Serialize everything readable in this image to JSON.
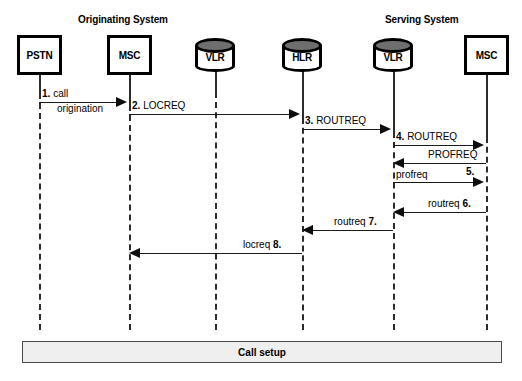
{
  "diagram": {
    "type": "sequence",
    "group_labels": [
      {
        "text": "Originating System",
        "x": 78,
        "y": 14
      },
      {
        "text": "Serving System",
        "x": 385,
        "y": 14
      }
    ],
    "actors": [
      {
        "id": "pstn",
        "label": "PSTN",
        "shape": "box",
        "x": 39,
        "box_left": 17,
        "box_top": 35,
        "box_w": 45,
        "box_h": 40
      },
      {
        "id": "msc_o",
        "label": "MSC",
        "shape": "box",
        "x": 129,
        "box_left": 107,
        "box_top": 35,
        "box_w": 45,
        "box_h": 40
      },
      {
        "id": "vlr_o",
        "label": "VLR",
        "shape": "cylinder",
        "x": 215,
        "box_left": 195,
        "box_top": 38,
        "box_w": 40,
        "box_h": 36
      },
      {
        "id": "hlr",
        "label": "HLR",
        "shape": "cylinder",
        "x": 302,
        "box_left": 282,
        "box_top": 38,
        "box_w": 40,
        "box_h": 36
      },
      {
        "id": "vlr_s",
        "label": "VLR",
        "shape": "cylinder",
        "x": 393,
        "box_left": 373,
        "box_top": 38,
        "box_w": 40,
        "box_h": 36
      },
      {
        "id": "msc_s",
        "label": "MSC",
        "shape": "box",
        "x": 486,
        "box_left": 464,
        "box_top": 35,
        "box_w": 45,
        "box_h": 40
      }
    ],
    "messages": [
      {
        "num": "1.",
        "label": "call",
        "label2": "origination",
        "from": "pstn",
        "to": "msc_o",
        "from_x": 39,
        "to_x": 129,
        "y": 102,
        "dir": "right"
      },
      {
        "num": "2.",
        "label": "LOCREQ",
        "from": "msc_o",
        "to": "hlr",
        "from_x": 129,
        "to_x": 302,
        "y": 114,
        "dir": "right"
      },
      {
        "num": "3.",
        "label": "ROUTREQ",
        "from": "hlr",
        "to": "vlr_s",
        "from_x": 302,
        "to_x": 393,
        "y": 129,
        "dir": "right"
      },
      {
        "num": "4.",
        "label": "ROUTREQ",
        "from": "vlr_s",
        "to": "msc_s",
        "from_x": 393,
        "to_x": 486,
        "y": 145,
        "dir": "right"
      },
      {
        "num": "5.",
        "label": "PROFREQ",
        "from": "msc_s",
        "to": "vlr_s",
        "from_x": 486,
        "to_x": 393,
        "y": 163,
        "dir": "left"
      },
      {
        "num": "",
        "label": "profreq",
        "from": "vlr_s",
        "to": "msc_s",
        "from_x": 393,
        "to_x": 486,
        "y": 182,
        "dir": "right"
      },
      {
        "num": "6.",
        "label": "routreq",
        "from": "msc_s",
        "to": "vlr_s",
        "from_x": 486,
        "to_x": 393,
        "y": 212,
        "dir": "left"
      },
      {
        "num": "7.",
        "label": "routreq",
        "from": "vlr_s",
        "to": "hlr",
        "from_x": 393,
        "to_x": 302,
        "y": 230,
        "dir": "left"
      },
      {
        "num": "8.",
        "label": "locreq",
        "from": "hlr",
        "to": "msc_o",
        "from_x": 302,
        "to_x": 129,
        "y": 253,
        "dir": "left"
      }
    ],
    "footer_bar": {
      "label": "Call setup",
      "x": 22,
      "y": 341,
      "w": 480,
      "h": 22
    }
  }
}
